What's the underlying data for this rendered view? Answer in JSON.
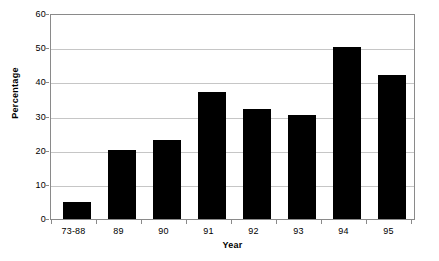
{
  "chart_data": {
    "type": "bar",
    "title": "",
    "subtitle": "",
    "categories": [
      "73-88",
      "89",
      "90",
      "91",
      "92",
      "93",
      "94",
      "95"
    ],
    "values": [
      5,
      20.2,
      23.2,
      37.5,
      32.5,
      30.5,
      50.5,
      42.5
    ],
    "xlabel": "Year",
    "ylabel": "Percentage",
    "ylim": [
      0,
      60
    ],
    "yticks": [
      0,
      10,
      20,
      30,
      40,
      50,
      60
    ],
    "ytick_labels": [
      "0",
      "10",
      "20",
      "30",
      "40",
      "50",
      "60"
    ],
    "grid": true,
    "grid_axis": "y",
    "legend": false,
    "legend_position": "none",
    "bar_color": "#000000",
    "grid_color": "#c6c6c6",
    "axis_color": "#8a8a8a",
    "background_color": "#ffffff",
    "annotations": []
  }
}
